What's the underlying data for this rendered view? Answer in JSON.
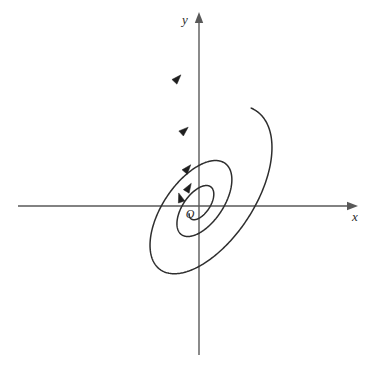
{
  "figure": {
    "kind": "phase-portrait",
    "title_visible": false,
    "background_color": "#ffffff",
    "width": 376,
    "height": 375
  },
  "axes": {
    "x_axis": {
      "label": "x",
      "label_x": 355,
      "label_y": 221,
      "y_pixel": 206,
      "x_start": 18,
      "x_end": 358,
      "color": "#595959",
      "arrow": "right"
    },
    "y_axis": {
      "label": "y",
      "label_x": 185,
      "label_y": 24,
      "x_pixel": 199,
      "y_start": 355,
      "y_end": 12,
      "color": "#595959",
      "arrow": "up"
    },
    "origin": {
      "label": "O",
      "x": 199,
      "y": 206,
      "label_x": 190,
      "label_y": 218
    }
  },
  "chart_data": {
    "type": "line",
    "title": "",
    "xlabel": "x",
    "ylabel": "y",
    "grid": false,
    "legend": "none",
    "spiral": {
      "center_x": 199,
      "center_y": 206,
      "tilt_degrees": 55,
      "aspect_ratio": 0.52,
      "growth_per_turn": 2.22,
      "start_radius": 14,
      "theta_start_degrees": 150,
      "turns": 2.62,
      "direction": "counterclockwise-outward"
    },
    "flow_arrows": [
      {
        "x": 178,
        "y": 78,
        "angle_degrees": -47
      },
      {
        "x": 185,
        "y": 130,
        "angle_degrees": -42
      },
      {
        "x": 188,
        "y": 168,
        "angle_degrees": -50
      },
      {
        "x": 189,
        "y": 187,
        "angle_degrees": -58
      },
      {
        "x": 180,
        "y": 197,
        "angle_degrees": -108
      }
    ],
    "extents": {
      "outer_free_end_x": 35,
      "outer_free_end_y": 345,
      "outer_top_y": 28,
      "outer_right_x": 318,
      "second_loop_top_y": 105,
      "second_loop_bottom_y": 345,
      "second_loop_left_x": 108,
      "second_loop_right_x": 262
    }
  },
  "colors": {
    "curve": "#2e2e2e",
    "axis": "#595959",
    "arrow": "#1f1f1f",
    "background": "#ffffff",
    "text": "#2b2b2b"
  }
}
